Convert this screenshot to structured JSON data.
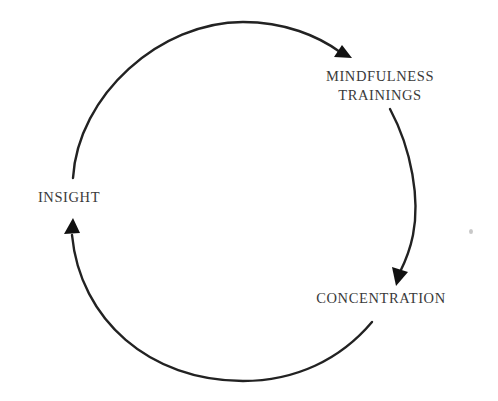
{
  "diagram": {
    "type": "cycle",
    "direction": "clockwise",
    "nodes": [
      {
        "id": "mindfulness",
        "lines": [
          "MINDFULNESS",
          "TRAININGS"
        ]
      },
      {
        "id": "concentration",
        "lines": [
          "CONCENTRATION"
        ]
      },
      {
        "id": "insight",
        "lines": [
          "INSIGHT"
        ]
      }
    ],
    "edges": [
      {
        "from": "insight",
        "to": "mindfulness"
      },
      {
        "from": "mindfulness",
        "to": "concentration"
      },
      {
        "from": "concentration",
        "to": "insight"
      }
    ],
    "colors": {
      "stroke": "#222222",
      "text": "#3a3a3a",
      "background": "#ffffff"
    }
  }
}
